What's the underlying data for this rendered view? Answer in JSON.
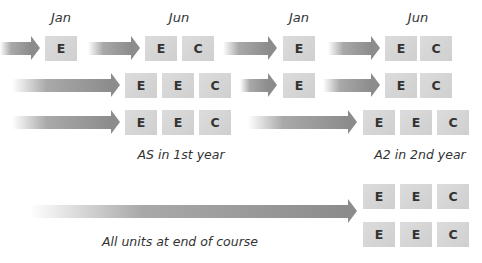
{
  "header": {
    "months": [
      {
        "label": "Jan",
        "x": 61,
        "y": 10
      },
      {
        "label": "Jun",
        "x": 179,
        "y": 10
      },
      {
        "label": "Jan",
        "x": 299,
        "y": 10
      },
      {
        "label": "Jun",
        "x": 418,
        "y": 10
      }
    ]
  },
  "rows": [
    {
      "y": 36,
      "arrows": [
        {
          "x": 0,
          "w": 40
        },
        {
          "x": 88,
          "w": 52
        },
        {
          "x": 223,
          "w": 54
        },
        {
          "x": 328,
          "w": 52
        }
      ],
      "boxes": [
        {
          "label": "E",
          "x": 45
        },
        {
          "label": "E",
          "x": 145
        },
        {
          "label": "C",
          "x": 182
        },
        {
          "label": "E",
          "x": 283
        },
        {
          "label": "E",
          "x": 385
        },
        {
          "label": "C",
          "x": 420
        }
      ]
    },
    {
      "y": 73,
      "arrows": [
        {
          "x": 12,
          "w": 108
        },
        {
          "x": 240,
          "w": 37
        },
        {
          "x": 323,
          "w": 57
        }
      ],
      "boxes": [
        {
          "label": "E",
          "x": 125
        },
        {
          "label": "E",
          "x": 162
        },
        {
          "label": "C",
          "x": 199
        },
        {
          "label": "E",
          "x": 283
        },
        {
          "label": "E",
          "x": 385
        },
        {
          "label": "C",
          "x": 420
        }
      ]
    },
    {
      "y": 110,
      "arrows": [
        {
          "x": 12,
          "w": 108
        },
        {
          "x": 248,
          "w": 109
        }
      ],
      "boxes": [
        {
          "label": "E",
          "x": 125
        },
        {
          "label": "E",
          "x": 162
        },
        {
          "label": "C",
          "x": 199
        },
        {
          "label": "E",
          "x": 363
        },
        {
          "label": "E",
          "x": 400
        },
        {
          "label": "C",
          "x": 437
        }
      ]
    }
  ],
  "captions": {
    "as_first_year": "AS in 1st year",
    "a2_second_year": "A2 in 2nd year",
    "all_units": "All units at end of course"
  },
  "bottom": {
    "arrow": {
      "x": 30,
      "w": 327,
      "y": 199
    },
    "box_rows": [
      {
        "y": 184,
        "boxes": [
          {
            "label": "E",
            "x": 363
          },
          {
            "label": "E",
            "x": 400
          },
          {
            "label": "C",
            "x": 437
          }
        ]
      },
      {
        "y": 222,
        "boxes": [
          {
            "label": "E",
            "x": 363
          },
          {
            "label": "E",
            "x": 400
          },
          {
            "label": "C",
            "x": 437
          }
        ]
      }
    ]
  },
  "colors": {
    "box": "#d6d6d6",
    "arrow": "#8c8c8c",
    "text": "#333333"
  }
}
